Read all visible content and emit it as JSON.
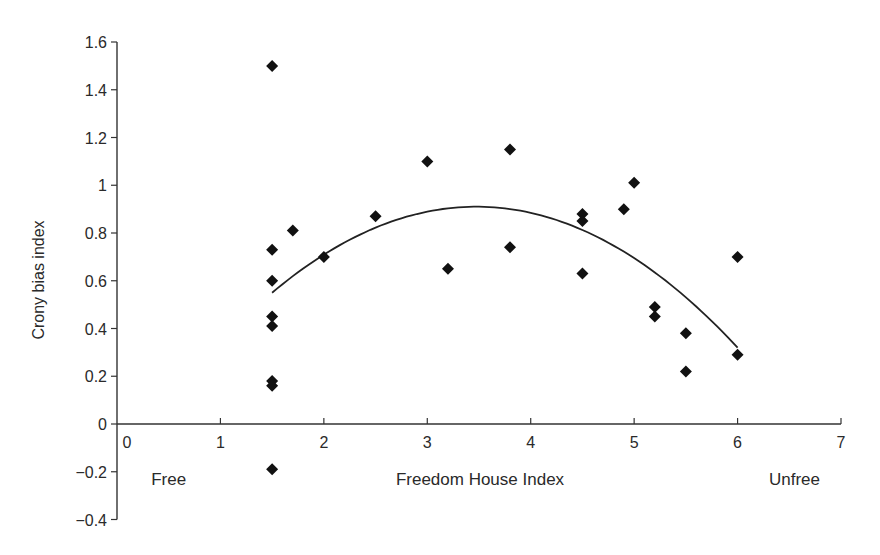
{
  "chart_data": {
    "type": "scatter",
    "title": "",
    "xlabel": "Freedom House Index",
    "ylabel": "Crony bias index",
    "xlim": [
      0,
      7
    ],
    "ylim": [
      -0.4,
      1.6
    ],
    "grid": false,
    "legend": null,
    "x_ticks": [
      "0",
      "1",
      "2",
      "3",
      "4",
      "5",
      "6",
      "7"
    ],
    "y_ticks": [
      "1.6",
      "1.4",
      "1.2",
      "1",
      "0.8",
      "0.6",
      "0.4",
      "0.2",
      "0",
      "−0.2",
      "−0.4"
    ],
    "annotations": [
      {
        "text": "Free",
        "x": 0.5,
        "y": -0.22
      },
      {
        "text": "Unfree",
        "x": 6.55,
        "y": -0.22
      }
    ],
    "series": [
      {
        "name": "Countries",
        "marker": "diamond",
        "points": [
          {
            "x": 1.5,
            "y": 1.5
          },
          {
            "x": 1.5,
            "y": 0.73
          },
          {
            "x": 1.5,
            "y": 0.6
          },
          {
            "x": 1.5,
            "y": 0.45
          },
          {
            "x": 1.5,
            "y": 0.41
          },
          {
            "x": 1.5,
            "y": 0.18
          },
          {
            "x": 1.5,
            "y": 0.16
          },
          {
            "x": 1.5,
            "y": -0.19
          },
          {
            "x": 1.7,
            "y": 0.81
          },
          {
            "x": 2.0,
            "y": 0.7
          },
          {
            "x": 2.5,
            "y": 0.87
          },
          {
            "x": 3.0,
            "y": 1.1
          },
          {
            "x": 3.2,
            "y": 0.65
          },
          {
            "x": 3.8,
            "y": 1.15
          },
          {
            "x": 3.8,
            "y": 0.74
          },
          {
            "x": 4.5,
            "y": 0.88
          },
          {
            "x": 4.5,
            "y": 0.85
          },
          {
            "x": 4.5,
            "y": 0.63
          },
          {
            "x": 4.9,
            "y": 0.9
          },
          {
            "x": 5.0,
            "y": 1.01
          },
          {
            "x": 5.2,
            "y": 0.49
          },
          {
            "x": 5.2,
            "y": 0.45
          },
          {
            "x": 5.5,
            "y": 0.38
          },
          {
            "x": 5.5,
            "y": 0.22
          },
          {
            "x": 6.0,
            "y": 0.7
          },
          {
            "x": 6.0,
            "y": 0.29
          }
        ]
      },
      {
        "name": "Quadratic fit",
        "type": "line",
        "x": [
          1.5,
          2.0,
          2.5,
          3.0,
          3.5,
          4.0,
          4.5,
          5.0,
          5.5,
          6.0
        ],
        "values": [
          0.55,
          0.71,
          0.82,
          0.89,
          0.91,
          0.88,
          0.81,
          0.69,
          0.53,
          0.32
        ]
      }
    ]
  }
}
